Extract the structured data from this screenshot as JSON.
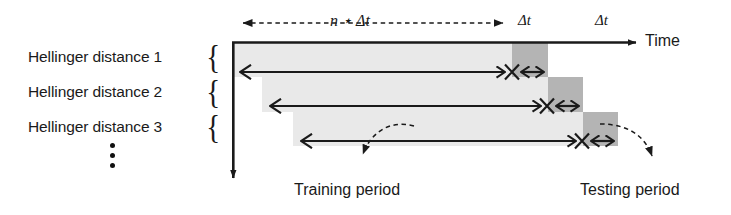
{
  "figure": {
    "type": "timeline-diagram",
    "axis": {
      "time_label": "Time",
      "vertical_axis_name": "hellinger-distance-index"
    },
    "top_annotations": {
      "span_label": "n ⋆ Δt",
      "delta_label_1": "Δt",
      "delta_label_2": "Δt"
    },
    "row_labels": [
      "Hellinger distance 1",
      "Hellinger distance 2",
      "Hellinger distance 3"
    ],
    "ellipsis": "⋮",
    "callouts": {
      "training": "Training period",
      "testing": "Testing period"
    },
    "colors": {
      "training_fill": "#e9e9e9",
      "testing_fill": "#b4b4b4",
      "stroke": "#1a1a1a",
      "background": "#ffffff"
    },
    "rows": [
      {
        "index": 1,
        "training_start": 232,
        "training_end": 512,
        "testing_start": 512,
        "testing_end": 548,
        "bar_top": 42,
        "bar_bottom": 77,
        "arrow_y": 72
      },
      {
        "index": 2,
        "training_start": 262,
        "training_end": 548,
        "testing_start": 548,
        "testing_end": 583,
        "bar_top": 77,
        "bar_bottom": 112,
        "arrow_y": 106
      },
      {
        "index": 3,
        "training_start": 293,
        "training_end": 583,
        "testing_start": 583,
        "testing_end": 618,
        "bar_top": 112,
        "bar_bottom": 146,
        "arrow_y": 141
      }
    ]
  }
}
